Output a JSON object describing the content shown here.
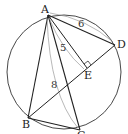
{
  "diagram": {
    "type": "geometry",
    "points": {
      "A": {
        "label": "A",
        "x": 48,
        "y": 15
      },
      "B": {
        "label": "B",
        "x": 28,
        "y": 118
      },
      "C": {
        "label": "C",
        "x": 80,
        "y": 130
      },
      "D": {
        "label": "D",
        "x": 115,
        "y": 45
      },
      "E": {
        "label": "E",
        "x": 87,
        "y": 68
      }
    },
    "circle": {
      "cx": 64,
      "cy": 72,
      "r": 57
    },
    "measures": {
      "AD": "6",
      "AE": "5",
      "AC": "8"
    },
    "right_angle_at": "E",
    "colors": {
      "stroke": "#222222",
      "thin_stroke": "#777777",
      "background": "#ffffff"
    }
  }
}
